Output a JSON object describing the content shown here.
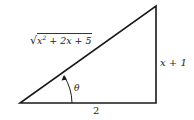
{
  "diagram": {
    "type": "right-triangle",
    "hypotenuse": {
      "label_radicand": "x² + 2x + 5",
      "radical": "√",
      "var": "x",
      "exp": "2",
      "rest": " + 2x + 5"
    },
    "opposite": {
      "label": "x + 1"
    },
    "adjacent": {
      "label": "2"
    },
    "angle": {
      "label": "θ",
      "vertex": "bottom-left"
    },
    "colors": {
      "stroke": "#1a1a1a",
      "text": "#222222",
      "background": "#ffffff"
    }
  }
}
